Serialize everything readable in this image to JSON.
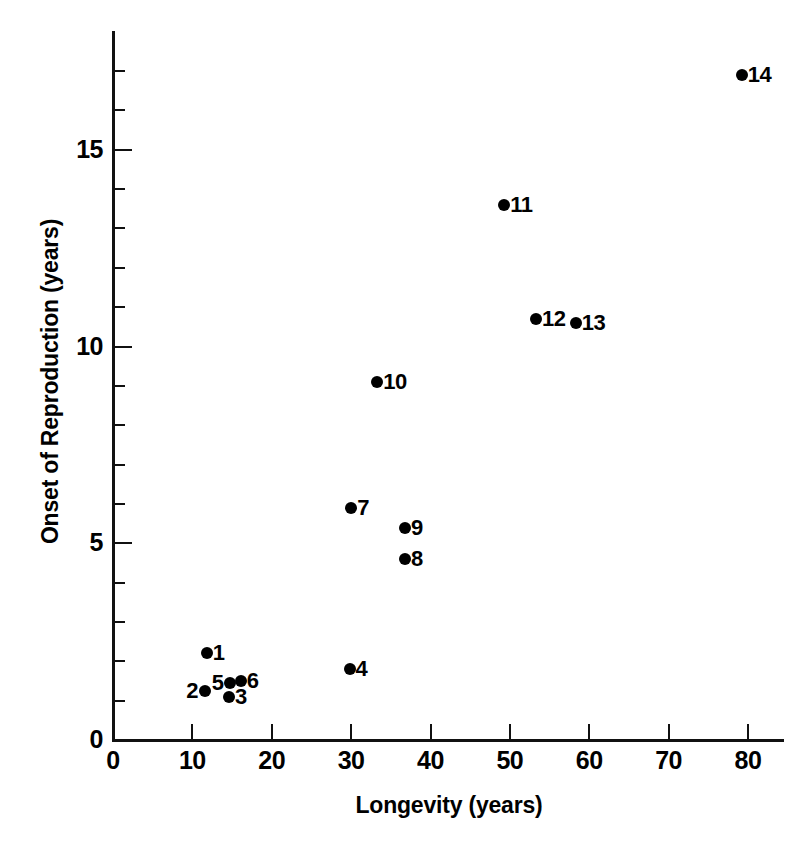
{
  "chart_data": {
    "type": "scatter",
    "title": "",
    "xlabel": "Longevity (years)",
    "ylabel": "Onset of Reproduction (years)",
    "xlim": [
      0,
      84.5
    ],
    "ylim": [
      0,
      18
    ],
    "grid": false,
    "legend": "none",
    "x_major_ticks": [
      0,
      10,
      20,
      30,
      40,
      50,
      60,
      70,
      80
    ],
    "x_tick_labels": [
      "0",
      "10",
      "20",
      "30",
      "40",
      "50",
      "60",
      "70",
      "80"
    ],
    "y_major_ticks": [
      0,
      5,
      10,
      15
    ],
    "y_tick_labels": [
      "0",
      "5",
      "10",
      "15"
    ],
    "y_minor_ticks": [
      1,
      2,
      3,
      4,
      6,
      7,
      8,
      9,
      11,
      12,
      13,
      14,
      16,
      17
    ],
    "marker": "filled-circle",
    "marker_color": "#000000",
    "points": [
      {
        "label": "1",
        "x": 11.8,
        "y": 2.2,
        "label_pos": "right"
      },
      {
        "label": "2",
        "x": 11.6,
        "y": 1.25,
        "label_pos": "left"
      },
      {
        "label": "3",
        "x": 14.6,
        "y": 1.1,
        "label_pos": "right"
      },
      {
        "label": "4",
        "x": 29.8,
        "y": 1.8,
        "label_pos": "right"
      },
      {
        "label": "5",
        "x": 14.8,
        "y": 1.45,
        "label_pos": "left"
      },
      {
        "label": "6",
        "x": 16.1,
        "y": 1.5,
        "label_pos": "right"
      },
      {
        "label": "7",
        "x": 30.0,
        "y": 5.9,
        "label_pos": "right"
      },
      {
        "label": "8",
        "x": 36.8,
        "y": 4.6,
        "label_pos": "right"
      },
      {
        "label": "9",
        "x": 36.8,
        "y": 5.4,
        "label_pos": "right"
      },
      {
        "label": "10",
        "x": 33.3,
        "y": 9.1,
        "label_pos": "right"
      },
      {
        "label": "11",
        "x": 49.3,
        "y": 13.6,
        "label_pos": "right"
      },
      {
        "label": "12",
        "x": 53.3,
        "y": 10.7,
        "label_pos": "right"
      },
      {
        "label": "13",
        "x": 58.3,
        "y": 10.6,
        "label_pos": "right"
      },
      {
        "label": "14",
        "x": 79.2,
        "y": 16.9,
        "label_pos": "right"
      }
    ]
  }
}
